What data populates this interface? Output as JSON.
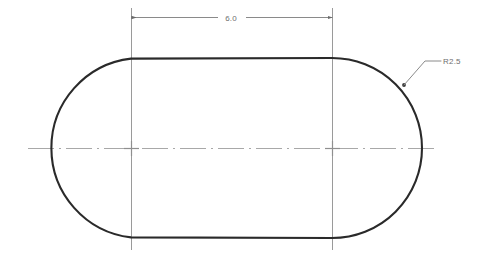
{
  "drawing": {
    "title": "Slot Profile Drawing",
    "type": "engineering-drawing",
    "canvas": {
      "width": 481,
      "height": 260,
      "background": "#ffffff"
    },
    "colors": {
      "object_line": "#2a2a2a",
      "construction_line": "#9a9a9a",
      "center_line": "#a8a8a8",
      "dimension_line": "#8a8a8a",
      "text": "#6e6e6e"
    },
    "shape": {
      "name": "obround-slot",
      "left_arc_center": {
        "x": 131,
        "y": 148
      },
      "right_arc_center": {
        "x": 332,
        "y": 148
      },
      "radius": 90,
      "left_extreme_x": 41,
      "right_extreme_x": 422,
      "top_y": 58,
      "bottom_y": 238,
      "line_width": 2.1
    },
    "dimensions": [
      {
        "id": "overall-length",
        "label": "6.0",
        "kind": "linear",
        "orientation": "horizontal",
        "dim_line_y": 17,
        "from_x": 131,
        "to_x": 332,
        "text_x": 231,
        "text_y": 20,
        "arrowheads": "filled-closed",
        "extension_lines": [
          {
            "x": 131,
            "y1": 8,
            "y2": 250
          },
          {
            "x": 332,
            "y1": 8,
            "y2": 250
          }
        ]
      },
      {
        "id": "corner-radius",
        "label": "R2.5",
        "kind": "radius",
        "leader": {
          "tip": {
            "x": 404,
            "y": 85
          },
          "elbow": {
            "x": 425,
            "y": 61
          },
          "shelf_end": {
            "x": 441,
            "y": 61
          }
        },
        "text_x": 443,
        "text_y": 64
      }
    ],
    "center_lines": [
      {
        "id": "horizontal-centerline",
        "orientation": "horizontal",
        "y": 148,
        "x1": 28,
        "x2": 436
      }
    ],
    "center_marks": [
      {
        "id": "left-arc-center-mark",
        "x": 131,
        "y": 148,
        "size": 13
      },
      {
        "id": "right-arc-center-mark",
        "x": 332,
        "y": 148,
        "size": 13
      }
    ]
  }
}
